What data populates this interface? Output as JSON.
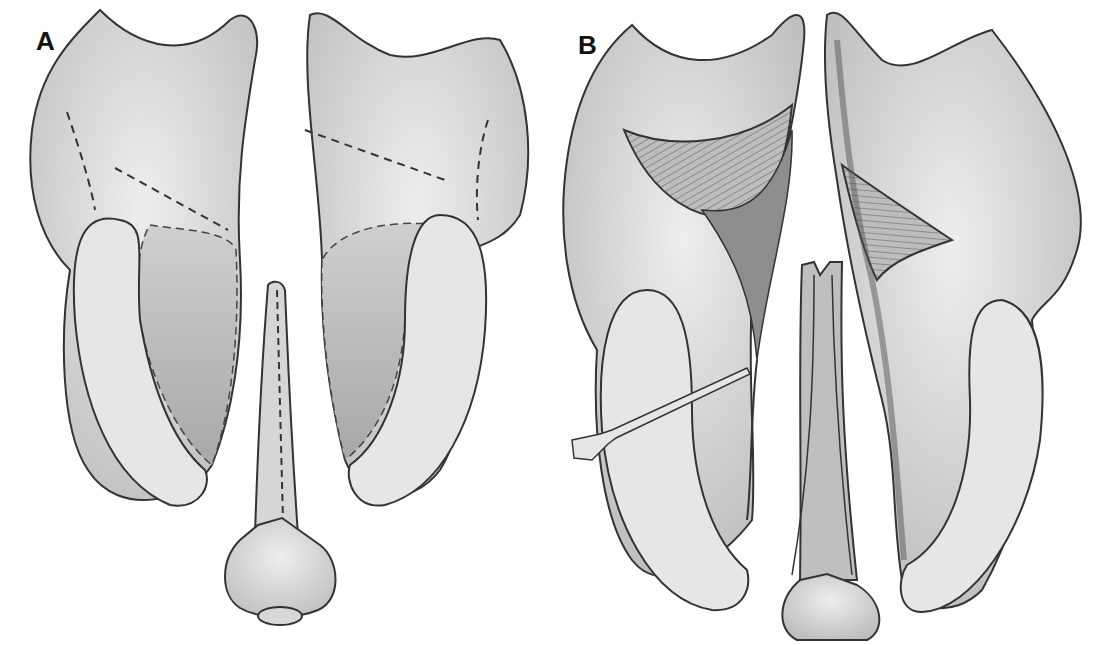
{
  "figure": {
    "panels": [
      {
        "label": "A",
        "description": "Palatal flaps outlined with dashed incision lines; vomer flap outlined on midline"
      },
      {
        "label": "B",
        "description": "Flaps elevated, nasal mucosa exposed with hatched muscle layer; vomer flaps reflected; instrument elevating flap"
      }
    ]
  },
  "colors": {
    "background": "#ffffff",
    "tissue_light": "#e2e2e2",
    "tissue_mid": "#c4c4c4",
    "tissue_dark": "#8a8a8a",
    "outline": "#333333"
  }
}
